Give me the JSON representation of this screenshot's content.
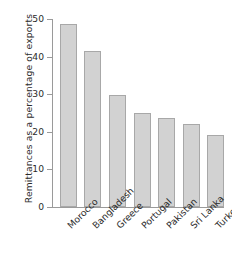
{
  "chart_data": {
    "type": "bar",
    "title": "",
    "xlabel": "",
    "ylabel": "Remittances as a percentage of exports",
    "ylim": [
      0,
      50
    ],
    "yticks": [
      0,
      10,
      20,
      30,
      40,
      50
    ],
    "ytick_labels": [
      "0",
      "10",
      "20",
      "30",
      "40",
      "50"
    ],
    "grid": false,
    "legend": false,
    "categories": [
      "Morocco",
      "Bangladesh",
      "Greece",
      "Portugal",
      "Pakistan",
      "Sri Lanka",
      "Turkey"
    ],
    "values": [
      48.7,
      41.5,
      29.8,
      25.0,
      23.7,
      22.0,
      19.2
    ],
    "bar_fill_color": "#d2d2d2",
    "bar_edge_color": "#a8a8a8",
    "axis_color": "#9a9a9a",
    "text_color": "#2b2b2b",
    "background_color": "#ffffff"
  }
}
